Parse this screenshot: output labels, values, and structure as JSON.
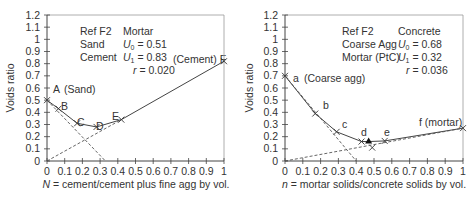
{
  "chart_data": [
    {
      "type": "line",
      "title": "",
      "xlabel": "N = cement/cement plus fine agg by vol.",
      "ylabel": "Voids ratio",
      "xlim": [
        0,
        1
      ],
      "ylim": [
        0,
        1.2
      ],
      "xticks": [
        "0",
        "0.1",
        "0.2",
        "0.3",
        "0.4",
        "0.5",
        "0.6",
        "0.7",
        "0.8",
        "0.9",
        "1"
      ],
      "yticks": [
        "0",
        "0.1",
        "0.2",
        "0.3",
        "0.4",
        "0.5",
        "0.6",
        "0.7",
        "0.8",
        "0.9",
        "1",
        "1.1",
        "1.2"
      ],
      "grid": false,
      "info": {
        "lines": [
          [
            "Ref F2",
            "Mortar"
          ],
          [
            "Sand",
            "U0 = 0.51"
          ],
          [
            "Cement",
            "U1 = 0.83"
          ],
          [
            "",
            "r = 0.020"
          ]
        ]
      },
      "series": [
        {
          "name": "measured",
          "style": "solid",
          "points": [
            {
              "label": "A (Sand)",
              "x": 0,
              "y": 0.5
            },
            {
              "label": "B",
              "x": 0.065,
              "y": 0.43
            },
            {
              "label": "C",
              "x": 0.17,
              "y": 0.31
            },
            {
              "label": "D",
              "x": 0.28,
              "y": 0.28
            },
            {
              "label": "E",
              "x": 0.42,
              "y": 0.34
            },
            {
              "label": "(Cement) F",
              "x": 1.0,
              "y": 0.82
            }
          ]
        },
        {
          "name": "coarse-limit",
          "style": "dashed",
          "x": [
            0,
            0.33
          ],
          "y": [
            0.5,
            0
          ]
        },
        {
          "name": "fine-limit",
          "style": "dashed",
          "x": [
            0,
            0.42
          ],
          "y": [
            0,
            0.34
          ]
        }
      ]
    },
    {
      "type": "line",
      "title": "",
      "xlabel": "n = mortar solids/concrete solids by vol.",
      "ylabel": "Voids ratio",
      "xlim": [
        0,
        1
      ],
      "ylim": [
        0,
        1.2
      ],
      "xticks": [
        "0",
        "0.1",
        "0.2",
        "0.3",
        "0.4",
        "0.5",
        "0.6",
        "0.7",
        "0.8",
        "0.9",
        "1"
      ],
      "yticks": [
        "0",
        "0.1",
        "0.2",
        "0.3",
        "0.4",
        "0.5",
        "0.6",
        "0.7",
        "0.8",
        "0.9",
        "1",
        "1.1",
        "1.2"
      ],
      "grid": false,
      "info": {
        "lines": [
          [
            "Ref F2",
            "Concrete"
          ],
          [
            "Coarse Agg",
            "U0 = 0.68"
          ],
          [
            "Mortar (PtC)",
            "U1 = 0.32"
          ],
          [
            "",
            "r = 0.036"
          ]
        ]
      },
      "series": [
        {
          "name": "measured",
          "style": "solid",
          "points": [
            {
              "label": "a (Coarse agg)",
              "x": 0,
              "y": 0.7
            },
            {
              "label": "b",
              "x": 0.17,
              "y": 0.39
            },
            {
              "label": "c",
              "x": 0.29,
              "y": 0.24
            },
            {
              "label": "d",
              "x": 0.43,
              "y": 0.16
            },
            {
              "label": "",
              "x": 0.47,
              "y": 0.16,
              "marker": "triangle"
            },
            {
              "label": "e",
              "x": 0.56,
              "y": 0.165
            },
            {
              "label": "f (mortar)",
              "x": 1.0,
              "y": 0.27
            }
          ]
        },
        {
          "name": "minimum",
          "style": "marker-only",
          "x": [
            0.49
          ],
          "y": [
            0.11
          ]
        },
        {
          "name": "coarse-limit",
          "style": "dashed",
          "x": [
            0,
            0.4
          ],
          "y": [
            0.7,
            0
          ]
        },
        {
          "name": "fine-limit",
          "style": "dashed",
          "x": [
            0,
            1.0
          ],
          "y": [
            0,
            0.27
          ]
        }
      ]
    }
  ],
  "labels": {
    "left": {
      "ylabel": "Voids ratio",
      "xlabel_var": "N",
      "xlabel_rest": " = cement/cement plus fine agg by vol.",
      "info": [
        "Ref F2",
        "Mortar",
        "Sand",
        "U",
        "0",
        " = 0.51",
        "Cement",
        "U",
        "1",
        " = 0.83",
        "r",
        " = 0.020"
      ],
      "pts": [
        "A",
        "(Sand)",
        "B",
        "C",
        "D",
        "E",
        "(Cement) F"
      ]
    },
    "right": {
      "ylabel": "Voids ratio",
      "xlabel_var": "n",
      "xlabel_rest": " = mortar solids/concrete solids by vol.",
      "info": [
        "Ref F2",
        "Concrete",
        "Coarse Agg",
        "U",
        "0",
        " = 0.68",
        "Mortar (PtC)",
        "U",
        "1",
        " = 0.32",
        "r",
        " = 0.036"
      ],
      "pts": [
        "a",
        "(Coarse agg)",
        "b",
        "c",
        "d",
        "e",
        "f (mortar)"
      ]
    }
  }
}
